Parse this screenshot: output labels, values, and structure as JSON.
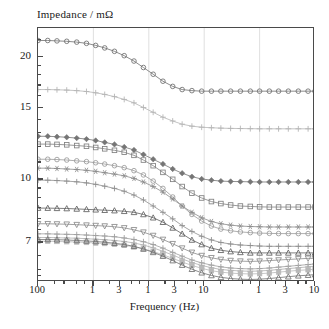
{
  "chart_data": {
    "type": "line",
    "title": "",
    "ylabel": "Impedance / mΩ",
    "xlabel": "Frequency (Hz)",
    "xscale": "log",
    "yscale": "log",
    "xlim": [
      0.1,
      10000
    ],
    "ylim": [
      5.6,
      23.5
    ],
    "grid": true,
    "grid_axis": "x",
    "legend": "none",
    "y_ticks": [
      {
        "value": 20,
        "label": "20"
      },
      {
        "value": 15,
        "label": "15"
      },
      {
        "value": 10,
        "label": "10"
      },
      {
        "value": 7,
        "label": "7"
      }
    ],
    "y_minor_ticks": [
      22,
      19,
      18,
      17,
      16,
      14,
      13,
      12,
      11,
      9.5,
      9,
      8.5,
      8,
      7.5,
      6.5,
      6,
      5.8
    ],
    "x_ticks": [
      {
        "value": 0.1,
        "label": "100"
      },
      {
        "value": 1,
        "label": "1"
      },
      {
        "value": 3,
        "label": "3"
      },
      {
        "value": 10,
        "label": "1"
      },
      {
        "value": 30,
        "label": "3"
      },
      {
        "value": 100,
        "label": "10"
      },
      {
        "value": 1000,
        "label": "1"
      },
      {
        "value": 3000,
        "label": "3"
      },
      {
        "value": 10000,
        "label": "10"
      }
    ],
    "x_gridlines": [
      1,
      10,
      100,
      1000
    ],
    "series": [
      {
        "name": "series-1",
        "marker": "circle-open",
        "color": "#6e6e6e",
        "x": [
          0.1,
          0.15,
          0.22,
          0.33,
          0.5,
          0.75,
          1.1,
          1.6,
          2.4,
          3.6,
          5.4,
          8,
          12,
          18,
          27,
          40,
          60,
          90,
          135,
          200,
          300,
          450,
          680,
          1000,
          1500,
          2200,
          3300,
          5000,
          7500,
          10000
        ],
        "y": [
          21.9,
          21.9,
          21.85,
          21.8,
          21.7,
          21.55,
          21.3,
          21.0,
          20.6,
          20.1,
          19.5,
          18.8,
          18.1,
          17.4,
          16.9,
          16.6,
          16.5,
          16.45,
          16.45,
          16.45,
          16.45,
          16.45,
          16.45,
          16.45,
          16.45,
          16.45,
          16.45,
          16.45,
          16.45,
          16.45
        ]
      },
      {
        "name": "series-2",
        "marker": "plus",
        "color": "#b5b5b5",
        "x": [
          0.1,
          0.15,
          0.22,
          0.33,
          0.5,
          0.75,
          1.1,
          1.6,
          2.4,
          3.6,
          5.4,
          8,
          12,
          18,
          27,
          40,
          60,
          90,
          135,
          200,
          300,
          450,
          680,
          1000,
          1500,
          2200,
          3300,
          5000,
          7500,
          10000
        ],
        "y": [
          16.6,
          16.6,
          16.58,
          16.55,
          16.5,
          16.42,
          16.3,
          16.15,
          15.95,
          15.7,
          15.4,
          15.0,
          14.6,
          14.2,
          13.9,
          13.65,
          13.5,
          13.42,
          13.38,
          13.35,
          13.33,
          13.32,
          13.31,
          13.3,
          13.3,
          13.3,
          13.3,
          13.3,
          13.3,
          13.3
        ]
      },
      {
        "name": "series-3",
        "marker": "diamond",
        "color": "#757575",
        "x": [
          0.1,
          0.15,
          0.22,
          0.33,
          0.5,
          0.75,
          1.1,
          1.6,
          2.4,
          3.6,
          5.4,
          8,
          12,
          18,
          27,
          40,
          60,
          90,
          135,
          200,
          300,
          450,
          680,
          1000,
          1500,
          2200,
          3300,
          5000,
          7500,
          10000
        ],
        "y": [
          12.75,
          12.75,
          12.72,
          12.68,
          12.62,
          12.55,
          12.45,
          12.32,
          12.18,
          12.0,
          11.8,
          11.5,
          11.2,
          10.9,
          10.6,
          10.35,
          10.15,
          10.02,
          9.95,
          9.9,
          9.88,
          9.87,
          9.86,
          9.85,
          9.85,
          9.85,
          9.85,
          9.85,
          9.85,
          9.85
        ]
      },
      {
        "name": "series-4",
        "marker": "square-open",
        "color": "#808080",
        "x": [
          0.1,
          0.15,
          0.22,
          0.33,
          0.5,
          0.75,
          1.1,
          1.6,
          2.4,
          3.6,
          5.4,
          8,
          12,
          18,
          27,
          40,
          60,
          90,
          135,
          200,
          300,
          450,
          680,
          1000,
          1500,
          2200,
          3300,
          5000,
          7500,
          10000
        ],
        "y": [
          12.2,
          12.2,
          12.18,
          12.15,
          12.1,
          12.05,
          11.97,
          11.88,
          11.78,
          11.65,
          11.45,
          11.15,
          10.8,
          10.4,
          10.0,
          9.6,
          9.25,
          9.0,
          8.82,
          8.72,
          8.65,
          8.6,
          8.58,
          8.56,
          8.55,
          8.55,
          8.55,
          8.55,
          8.55,
          8.55
        ]
      },
      {
        "name": "series-5",
        "marker": "circle-open",
        "color": "#9a9a9a",
        "x": [
          0.1,
          0.15,
          0.22,
          0.33,
          0.5,
          0.75,
          1.1,
          1.6,
          2.4,
          3.6,
          5.4,
          8,
          12,
          18,
          27,
          40,
          60,
          90,
          135,
          200,
          300,
          450,
          680,
          1000,
          1500,
          2200,
          3300,
          5000,
          7500,
          10000
        ],
        "y": [
          11.2,
          11.2,
          11.18,
          11.15,
          11.1,
          11.05,
          10.98,
          10.9,
          10.8,
          10.68,
          10.5,
          10.25,
          9.9,
          9.5,
          9.05,
          8.6,
          8.2,
          7.9,
          7.68,
          7.55,
          7.48,
          7.43,
          7.4,
          7.38,
          7.37,
          7.36,
          7.36,
          7.36,
          7.36,
          7.36
        ]
      },
      {
        "name": "series-6",
        "marker": "star",
        "color": "#8a8a8a",
        "x": [
          0.1,
          0.15,
          0.22,
          0.33,
          0.5,
          0.75,
          1.1,
          1.6,
          2.4,
          3.6,
          5.4,
          8,
          12,
          18,
          27,
          40,
          60,
          90,
          135,
          200,
          300,
          450,
          680,
          1000,
          1500,
          2200,
          3300,
          5000,
          7500,
          10000
        ],
        "y": [
          10.65,
          10.65,
          10.63,
          10.6,
          10.57,
          10.52,
          10.46,
          10.38,
          10.3,
          10.2,
          10.05,
          9.85,
          9.6,
          9.3,
          8.95,
          8.6,
          8.3,
          8.05,
          7.88,
          7.78,
          7.72,
          7.68,
          7.66,
          7.65,
          7.64,
          7.64,
          7.64,
          7.64,
          7.64,
          7.64
        ]
      },
      {
        "name": "series-7",
        "marker": "plus",
        "color": "#8f8f8f",
        "x": [
          0.1,
          0.15,
          0.22,
          0.33,
          0.5,
          0.75,
          1.1,
          1.6,
          2.4,
          3.6,
          5.4,
          8,
          12,
          18,
          27,
          40,
          60,
          90,
          135,
          200,
          300,
          450,
          680,
          1000,
          1500,
          2200,
          3300,
          5000,
          7500,
          10000
        ],
        "y": [
          9.95,
          9.95,
          9.93,
          9.9,
          9.86,
          9.8,
          9.72,
          9.62,
          9.5,
          9.35,
          9.15,
          8.9,
          8.6,
          8.3,
          8.0,
          7.7,
          7.45,
          7.25,
          7.1,
          7.0,
          6.94,
          6.9,
          6.88,
          6.86,
          6.85,
          6.85,
          6.85,
          6.85,
          6.85,
          6.85
        ]
      },
      {
        "name": "series-8",
        "marker": "triangle-up",
        "color": "#5e5e5e",
        "x": [
          0.1,
          0.15,
          0.22,
          0.33,
          0.5,
          0.75,
          1.1,
          1.6,
          2.4,
          3.6,
          5.4,
          8,
          12,
          18,
          27,
          40,
          60,
          90,
          135,
          200,
          300,
          450,
          680,
          1000,
          1500,
          2200,
          3300,
          5000,
          7500,
          10000
        ],
        "y": [
          8.5,
          8.5,
          8.49,
          8.48,
          8.46,
          8.44,
          8.42,
          8.4,
          8.38,
          8.35,
          8.3,
          8.2,
          8.05,
          7.85,
          7.6,
          7.35,
          7.1,
          6.92,
          6.78,
          6.7,
          6.65,
          6.62,
          6.6,
          6.6,
          6.6,
          6.6,
          6.6,
          6.6,
          6.6,
          6.6
        ]
      },
      {
        "name": "series-9",
        "marker": "triangle-down",
        "color": "#8a8a8a",
        "x": [
          0.1,
          0.15,
          0.22,
          0.33,
          0.5,
          0.75,
          1.1,
          1.6,
          2.4,
          3.6,
          5.4,
          8,
          12,
          18,
          27,
          40,
          60,
          90,
          135,
          200,
          300,
          450,
          680,
          1000,
          1500,
          2200,
          3300,
          5000,
          7500,
          10000
        ],
        "y": [
          7.78,
          7.78,
          7.77,
          7.76,
          7.74,
          7.72,
          7.7,
          7.68,
          7.65,
          7.6,
          7.52,
          7.42,
          7.28,
          7.12,
          6.95,
          6.78,
          6.62,
          6.5,
          6.42,
          6.36,
          6.32,
          6.3,
          6.29,
          6.3,
          6.32,
          6.34,
          6.36,
          6.38,
          6.4,
          6.4
        ]
      },
      {
        "name": "series-10",
        "marker": "plus",
        "color": "#9e9e9e",
        "x": [
          0.1,
          0.15,
          0.22,
          0.33,
          0.5,
          0.75,
          1.1,
          1.6,
          2.4,
          3.6,
          5.4,
          8,
          12,
          18,
          27,
          40,
          60,
          90,
          135,
          200,
          300,
          450,
          680,
          1000,
          1500,
          2200,
          3300,
          5000,
          7500,
          10000
        ],
        "y": [
          7.35,
          7.35,
          7.34,
          7.33,
          7.32,
          7.3,
          7.28,
          7.26,
          7.23,
          7.18,
          7.12,
          7.03,
          6.92,
          6.78,
          6.62,
          6.48,
          6.34,
          6.24,
          6.16,
          6.1,
          6.06,
          6.04,
          6.03,
          6.04,
          6.06,
          6.09,
          6.12,
          6.15,
          6.18,
          6.2
        ]
      },
      {
        "name": "series-11",
        "marker": "plus",
        "color": "#adadad",
        "x": [
          0.1,
          0.15,
          0.22,
          0.33,
          0.5,
          0.75,
          1.1,
          1.6,
          2.4,
          3.6,
          5.4,
          8,
          12,
          18,
          27,
          40,
          60,
          90,
          135,
          200,
          300,
          450,
          680,
          1000,
          1500,
          2200,
          3300,
          5000,
          7500,
          10000
        ],
        "y": [
          7.2,
          7.2,
          7.19,
          7.18,
          7.17,
          7.15,
          7.13,
          7.11,
          7.08,
          7.04,
          6.98,
          6.9,
          6.79,
          6.66,
          6.52,
          6.38,
          6.25,
          6.15,
          6.07,
          6.01,
          5.98,
          5.96,
          5.95,
          5.96,
          5.98,
          6.01,
          6.04,
          6.07,
          6.1,
          6.12
        ]
      },
      {
        "name": "series-12",
        "marker": "square-filled",
        "color": "#b8b8b8",
        "x": [
          0.1,
          0.15,
          0.22,
          0.33,
          0.5,
          0.75,
          1.1,
          1.6,
          2.4,
          3.6,
          5.4,
          8,
          12,
          18,
          27,
          40,
          60,
          90,
          135,
          200,
          300,
          450,
          680,
          1000,
          1500,
          2200,
          3300,
          5000,
          7500,
          10000
        ],
        "y": [
          7.05,
          7.05,
          7.04,
          7.03,
          7.02,
          7.0,
          6.98,
          6.96,
          6.93,
          6.89,
          6.83,
          6.75,
          6.65,
          6.53,
          6.4,
          6.27,
          6.15,
          6.05,
          5.97,
          5.92,
          5.89,
          5.87,
          5.86,
          5.87,
          5.89,
          5.92,
          5.95,
          5.98,
          6.0,
          6.02
        ]
      },
      {
        "name": "series-13",
        "marker": "triangle-up",
        "color": "#707070",
        "x": [
          0.1,
          0.15,
          0.22,
          0.33,
          0.5,
          0.75,
          1.1,
          1.6,
          2.4,
          3.6,
          5.4,
          8,
          12,
          18,
          27,
          40,
          60,
          90,
          135,
          200,
          300,
          450,
          680,
          1000,
          1500,
          2200,
          3300,
          5000,
          7500,
          10000
        ],
        "y": [
          7.12,
          7.12,
          7.11,
          7.1,
          7.08,
          7.06,
          7.04,
          7.01,
          6.97,
          6.92,
          6.85,
          6.75,
          6.62,
          6.48,
          6.32,
          6.16,
          6.02,
          5.9,
          5.81,
          5.75,
          5.71,
          5.69,
          5.68,
          5.69,
          5.71,
          5.74,
          5.77,
          5.8,
          5.82,
          5.84
        ]
      }
    ]
  }
}
